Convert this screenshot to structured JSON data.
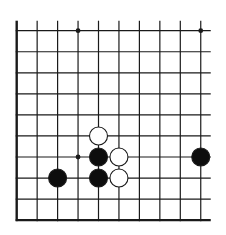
{
  "diagram": {
    "type": "go-board-partial",
    "columns": 10,
    "rows": 10,
    "origin": {
      "x": 16.7,
      "y": 30.7
    },
    "spacing": {
      "x": 20.45,
      "y": 21.05
    },
    "edges": {
      "left": true,
      "bottom": true,
      "top": false,
      "right": false
    },
    "overhang": {
      "top": 10,
      "right": 10
    },
    "stone_radius": 9,
    "colors": {
      "background": "#ffffff",
      "line": "#1a1a1a",
      "black_stone": "#0d0d0d",
      "white_stone": "#ffffff",
      "stone_outline": "#1a1a1a"
    },
    "star_points": [
      {
        "col": 3,
        "row": 0
      },
      {
        "col": 9,
        "row": 0
      },
      {
        "col": 3,
        "row": 6
      }
    ],
    "stones": [
      {
        "color": "white",
        "col": 4,
        "row": 5
      },
      {
        "color": "black",
        "col": 4,
        "row": 6
      },
      {
        "color": "white",
        "col": 5,
        "row": 6
      },
      {
        "color": "black",
        "col": 9,
        "row": 6
      },
      {
        "color": "black",
        "col": 2,
        "row": 7
      },
      {
        "color": "black",
        "col": 4,
        "row": 7
      },
      {
        "color": "white",
        "col": 5,
        "row": 7
      }
    ]
  }
}
